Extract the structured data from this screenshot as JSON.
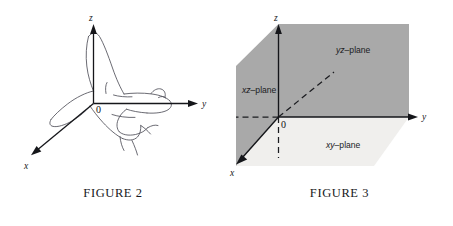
{
  "figures": [
    {
      "id": "figure-2",
      "caption": "FIGURE 2",
      "description": "right-hand-rule-hand-with-3d-axes",
      "axes": [
        {
          "name": "z-axis",
          "label": "z",
          "direction": "up"
        },
        {
          "name": "y-axis",
          "label": "y",
          "direction": "right"
        },
        {
          "name": "x-axis",
          "label": "x",
          "direction": "down-left"
        }
      ],
      "origin_label": "0"
    },
    {
      "id": "figure-3",
      "caption": "FIGURE 3",
      "description": "three-coordinate-planes",
      "axes": [
        {
          "name": "z-axis",
          "label": "z",
          "direction": "up"
        },
        {
          "name": "y-axis",
          "label": "y",
          "direction": "right"
        },
        {
          "name": "x-axis",
          "label": "x",
          "direction": "down-left"
        }
      ],
      "origin_label": "0",
      "planes": [
        {
          "name": "yz-plane",
          "label_italic": "yz",
          "label_rest": "–plane"
        },
        {
          "name": "xz-plane",
          "label_italic": "xz",
          "label_rest": "–plane"
        },
        {
          "name": "xy-plane",
          "label_italic": "xy",
          "label_rest": "–plane"
        }
      ]
    }
  ],
  "colors": {
    "background": "#ffffff",
    "plane_vertical_fill": "#a9a9a9",
    "plane_horizontal_fill": "#f0efed",
    "axis_stroke": "#15161a",
    "hand_stroke": "#4a4a52",
    "text": "#17181a"
  }
}
